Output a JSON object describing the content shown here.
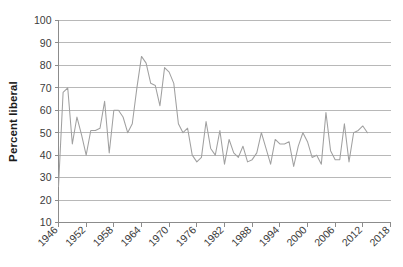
{
  "chart_data": {
    "type": "line",
    "title": "",
    "subtitle": "",
    "xlabel": "",
    "ylabel": "Percent liberal",
    "ylim": [
      10,
      100
    ],
    "xlim": [
      1946,
      2018
    ],
    "ytick_labels": [
      "100",
      "90",
      "80",
      "70",
      "60",
      "50",
      "40",
      "30",
      "20",
      "10"
    ],
    "yticks": [
      100,
      90,
      80,
      70,
      60,
      50,
      40,
      30,
      20,
      10
    ],
    "xtick_labels": [
      "1946",
      "1952",
      "1958",
      "1964",
      "1970",
      "1976",
      "1982",
      "1988",
      "1994",
      "2000",
      "2006",
      "2012",
      "2018"
    ],
    "xticks": [
      1946,
      1952,
      1958,
      1964,
      1970,
      1976,
      1982,
      1988,
      1994,
      2000,
      2006,
      2012,
      2018
    ],
    "grid": true,
    "legend": false,
    "legend_position": "none",
    "line_color": "#a0a0a0",
    "grid_color": "#a6a6a6",
    "axis_color": "#8c8c8c",
    "text_color": "#3b3b3b",
    "background_color": "#ffffff",
    "series": [
      {
        "name": "Percent liberal",
        "x": [
          1946,
          1947,
          1948,
          1949,
          1950,
          1951,
          1952,
          1953,
          1954,
          1955,
          1956,
          1957,
          1958,
          1959,
          1960,
          1961,
          1962,
          1963,
          1964,
          1965,
          1966,
          1967,
          1968,
          1969,
          1970,
          1971,
          1972,
          1973,
          1974,
          1975,
          1976,
          1977,
          1978,
          1979,
          1980,
          1981,
          1982,
          1983,
          1984,
          1985,
          1986,
          1987,
          1988,
          1989,
          1990,
          1991,
          1992,
          1993,
          1994,
          1995,
          1996,
          1997,
          1998,
          1999,
          2000,
          2001,
          2002,
          2003,
          2004,
          2005,
          2006,
          2007,
          2008,
          2009,
          2010,
          2011,
          2012,
          2013
        ],
        "values": [
          26,
          68,
          70,
          45,
          57,
          49,
          40,
          51,
          51,
          52,
          64,
          41,
          60,
          60,
          57,
          50,
          54,
          70,
          84,
          81,
          72,
          71,
          62,
          79,
          77,
          72,
          54,
          50,
          52,
          40,
          37,
          39,
          55,
          43,
          40,
          51,
          36,
          47,
          41,
          39,
          44,
          37,
          38,
          41,
          50,
          43,
          36,
          47,
          45,
          45,
          46,
          35,
          44,
          50,
          46,
          39,
          40,
          36,
          59,
          42,
          38,
          38,
          54,
          37,
          50,
          51,
          53,
          50
        ]
      }
    ]
  }
}
